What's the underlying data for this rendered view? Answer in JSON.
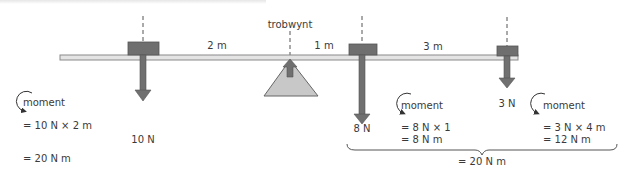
{
  "diagram": {
    "pivot_label": "trobwynt",
    "colors": {
      "beam_fill": "#e4e4e4",
      "beam_stroke": "#8a8a8a",
      "weight_fill": "#6f6f6f",
      "arrow_fill": "#707070",
      "pivot_fill": "#c8c8c8",
      "text": "#3a3a3a"
    },
    "distances": [
      {
        "id": "left",
        "label": "2 m"
      },
      {
        "id": "middle",
        "label": "1 m"
      },
      {
        "id": "right",
        "label": "3 m"
      }
    ],
    "forces": [
      {
        "id": "left",
        "label": "10 N"
      },
      {
        "id": "middle",
        "label": "8 N"
      },
      {
        "id": "right",
        "label": "3 N"
      }
    ],
    "moments": {
      "left": {
        "word": "moment",
        "line1": "= 10 N × 2 m",
        "line2": "= 20 N m"
      },
      "middle": {
        "word": "moment",
        "line1": "= 8 N × 1",
        "line2": "= 8 N m"
      },
      "right": {
        "word": "moment",
        "line1": "= 3 N × 4 m",
        "line2": "= 12 N m"
      },
      "total": "= 20 N m"
    }
  }
}
